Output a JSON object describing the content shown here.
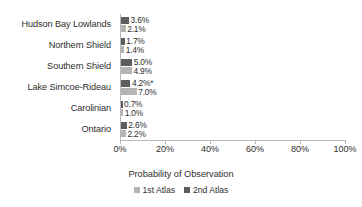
{
  "chart_data": {
    "type": "bar",
    "orientation": "horizontal",
    "title": "",
    "xlabel": "Probability of Observation",
    "ylabel": "",
    "xlim": [
      0,
      100
    ],
    "xunit": "%",
    "grid": false,
    "legend_position": "bottom",
    "categories": [
      "Hudson Bay Lowlands",
      "Northern Shield",
      "Southern Shield",
      "Lake Simcoe-Rideau",
      "Carolinian",
      "Ontario"
    ],
    "tick_labels": [
      "0%",
      "20%",
      "40%",
      "60%",
      "80%",
      "100%"
    ],
    "tick_values": [
      0,
      20,
      40,
      60,
      80,
      100
    ],
    "series": [
      {
        "name": "2nd Atlas",
        "color": "#5d5d5d",
        "values": [
          3.6,
          1.7,
          5.0,
          4.2,
          0.7,
          2.6
        ],
        "labels": [
          "3.6%",
          "1.7%",
          "5.0%",
          "4.2%*",
          "0.7%",
          "2.6%"
        ]
      },
      {
        "name": "1st Atlas",
        "color": "#b4b4b4",
        "values": [
          2.1,
          1.4,
          4.9,
          7.0,
          1.0,
          2.2
        ],
        "labels": [
          "2.1%",
          "1.4%",
          "4.9%",
          "7.0%",
          "1.0%",
          "2.2%"
        ]
      }
    ],
    "annotations": [
      "* denotes significance marker on Lake Simcoe-Rideau 2nd Atlas value"
    ]
  },
  "legend": {
    "items": [
      {
        "label": "1st Atlas",
        "swatch": "s1"
      },
      {
        "label": "2nd Atlas",
        "swatch": "s2"
      }
    ]
  }
}
